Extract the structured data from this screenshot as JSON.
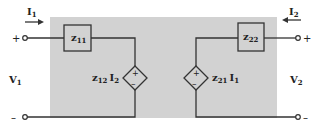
{
  "diagram": {
    "colors": {
      "network_fill": "#d2d2d2",
      "wire": "#333333",
      "background": "#ffffff"
    },
    "port1": {
      "current": {
        "symbol": "I",
        "sub": "1"
      },
      "voltage": {
        "symbol": "V",
        "sub": "1"
      },
      "plus": "+",
      "minus": "–"
    },
    "port2": {
      "current": {
        "symbol": "I",
        "sub": "2"
      },
      "voltage": {
        "symbol": "V",
        "sub": "2"
      },
      "plus": "+",
      "minus": "–"
    },
    "impedances": [
      {
        "id": "z11",
        "symbol": "z",
        "sub": "11"
      },
      {
        "id": "z22",
        "symbol": "z",
        "sub": "22"
      }
    ],
    "sources": [
      {
        "id": "left",
        "coef": "z",
        "coef_sub": "12",
        "ctrl": "I",
        "ctrl_sub": "2",
        "plus": "+",
        "minus": "–"
      },
      {
        "id": "right",
        "coef": "z",
        "coef_sub": "21",
        "ctrl": "I",
        "ctrl_sub": "1",
        "plus": "+",
        "minus": "–"
      }
    ]
  }
}
